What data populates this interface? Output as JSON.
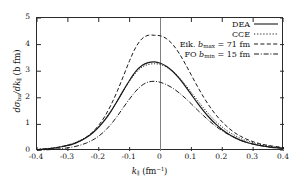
{
  "chart_data": {
    "type": "line",
    "title": "",
    "xlabel": "k∥ (fm⁻¹)",
    "ylabel": "dσbu/dk∥ (b fm)",
    "xlim": [
      -0.4,
      0.4
    ],
    "ylim": [
      0,
      5
    ],
    "xticks": [
      "-0.4",
      "-0.3",
      "-0.2",
      "-0.1",
      "0",
      "0.1",
      "0.2",
      "0.3",
      "0.4"
    ],
    "xtick_values": [
      -0.4,
      -0.3,
      -0.2,
      -0.1,
      0,
      0.1,
      0.2,
      0.3,
      0.4
    ],
    "yticks": [
      "0",
      "1",
      "2",
      "3",
      "4",
      "5"
    ],
    "ytick_values": [
      0,
      1,
      2,
      3,
      4,
      5
    ],
    "grid": false,
    "legend_position": "top-right",
    "annotations": [
      {
        "name": "zero-vertical-line",
        "type": "vline",
        "x": 0,
        "color": "#808080"
      }
    ],
    "x": [
      -0.4,
      -0.38,
      -0.36,
      -0.34,
      -0.32,
      -0.3,
      -0.28,
      -0.26,
      -0.24,
      -0.22,
      -0.2,
      -0.18,
      -0.16,
      -0.14,
      -0.12,
      -0.1,
      -0.08,
      -0.06,
      -0.04,
      -0.02,
      0.0,
      0.02,
      0.04,
      0.06,
      0.08,
      0.1,
      0.12,
      0.14,
      0.16,
      0.18,
      0.2,
      0.22,
      0.24,
      0.26,
      0.28,
      0.3,
      0.32,
      0.34,
      0.36,
      0.38,
      0.4
    ],
    "series": [
      {
        "name": "DEA",
        "style": "solid",
        "color": "#1a1a1a",
        "peak_x": -0.02,
        "peak_y": 3.35,
        "values": [
          0.05,
          0.07,
          0.09,
          0.12,
          0.16,
          0.21,
          0.28,
          0.38,
          0.51,
          0.68,
          0.9,
          1.17,
          1.5,
          1.88,
          2.28,
          2.66,
          2.99,
          3.21,
          3.32,
          3.35,
          3.3,
          3.18,
          2.99,
          2.74,
          2.44,
          2.12,
          1.8,
          1.5,
          1.23,
          1.0,
          0.8,
          0.64,
          0.51,
          0.4,
          0.32,
          0.26,
          0.21,
          0.17,
          0.14,
          0.12,
          0.1
        ]
      },
      {
        "name": "CCE",
        "style": "dotted",
        "color": "#1a1a1a",
        "peak_x": -0.02,
        "peak_y": 3.28,
        "values": [
          0.06,
          0.08,
          0.1,
          0.13,
          0.17,
          0.23,
          0.3,
          0.4,
          0.53,
          0.7,
          0.92,
          1.19,
          1.51,
          1.88,
          2.26,
          2.63,
          2.94,
          3.15,
          3.25,
          3.28,
          3.25,
          3.15,
          2.99,
          2.77,
          2.5,
          2.2,
          1.9,
          1.61,
          1.34,
          1.1,
          0.9,
          0.73,
          0.59,
          0.47,
          0.38,
          0.31,
          0.25,
          0.21,
          0.17,
          0.14,
          0.12
        ]
      },
      {
        "name": "Eik. bmax = 71 fm",
        "label_prefix": "Eik.",
        "label_symbol": "b",
        "label_subscript": "max",
        "label_value": "71 fm",
        "style": "dashed",
        "color": "#1a1a1a",
        "peak_x": 0.0,
        "peak_y": 4.35,
        "values": [
          0.05,
          0.07,
          0.09,
          0.12,
          0.16,
          0.21,
          0.28,
          0.38,
          0.52,
          0.71,
          0.97,
          1.31,
          1.74,
          2.25,
          2.82,
          3.4,
          3.9,
          4.22,
          4.35,
          4.35,
          4.33,
          4.22,
          4.0,
          3.68,
          3.28,
          2.85,
          2.42,
          2.02,
          1.66,
          1.35,
          1.09,
          0.87,
          0.69,
          0.55,
          0.44,
          0.35,
          0.28,
          0.23,
          0.19,
          0.16,
          0.13
        ]
      },
      {
        "name": "FO bmin = 15 fm",
        "label_prefix": "FO",
        "label_symbol": "b",
        "label_subscript": "min",
        "label_value": "15 fm",
        "style": "dashdot",
        "color": "#1a1a1a",
        "peak_x": -0.02,
        "peak_y": 2.62,
        "values": [
          0.03,
          0.04,
          0.05,
          0.07,
          0.09,
          0.12,
          0.16,
          0.22,
          0.3,
          0.41,
          0.56,
          0.76,
          1.01,
          1.31,
          1.64,
          1.96,
          2.25,
          2.47,
          2.59,
          2.62,
          2.58,
          2.49,
          2.36,
          2.19,
          1.99,
          1.77,
          1.54,
          1.32,
          1.11,
          0.92,
          0.76,
          0.62,
          0.5,
          0.4,
          0.32,
          0.26,
          0.21,
          0.17,
          0.14,
          0.12,
          0.1
        ]
      }
    ]
  },
  "legend": {
    "entries": [
      {
        "label": "DEA",
        "style": "solid"
      },
      {
        "label": "CCE",
        "style": "dotted"
      },
      {
        "label": "Eik. bmax = 71 fm",
        "style": "dashed"
      },
      {
        "label": "FO bmin = 15 fm",
        "style": "dashdot"
      }
    ]
  }
}
